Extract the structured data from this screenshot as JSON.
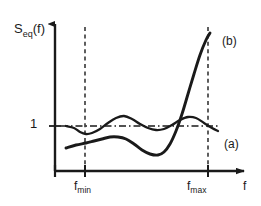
{
  "figure": {
    "kind": "line-plot",
    "background_color": "#ffffff",
    "ink_color": "#1a1a1a"
  },
  "axes": {
    "y_axis_label": "S",
    "y_axis_label_subscript": "eq",
    "y_axis_label_suffix": "(f)",
    "x_axis_label": "f",
    "y_reference_tick_label": "1",
    "x_tick_labels": [
      {
        "base": "f",
        "sub": "min"
      },
      {
        "base": "f",
        "sub": "max"
      }
    ]
  },
  "curve_labels": {
    "curve_a": "(a)",
    "curve_b": "(b)"
  },
  "chart_data": {
    "type": "line",
    "title": "",
    "xlabel": "f",
    "ylabel": "S_eq(f)",
    "xlim": [
      0,
      1
    ],
    "ylim": [
      0,
      1
    ],
    "grid": false,
    "legend_position": "inline-right",
    "annotations": [
      {
        "text": "(a)",
        "x_px": 224,
        "y_px": 138
      },
      {
        "text": "(b)",
        "x_px": 222,
        "y_px": 35
      },
      {
        "text": "1",
        "x_px": 30,
        "y_px": 117
      },
      {
        "text": "f_min",
        "x_px": 74,
        "y_px": 180
      },
      {
        "text": "f_max",
        "x_px": 187,
        "y_px": 180
      },
      {
        "text": "f",
        "x_px": 243,
        "y_px": 180
      }
    ],
    "reference_lines": [
      {
        "name": "unity-level",
        "orientation": "horizontal",
        "value_label": "1",
        "style": "dash-dot",
        "y_px": 126
      },
      {
        "name": "f-min-marker",
        "orientation": "vertical",
        "value_label": "f_min",
        "style": "dashed",
        "x_px": 85
      },
      {
        "name": "f-max-marker",
        "orientation": "vertical",
        "value_label": "f_max",
        "style": "dashed",
        "x_px": 208
      }
    ],
    "series": [
      {
        "name": "(a)",
        "description": "oscillating response staying near unity across the passband",
        "points_px": [
          [
            66,
            126
          ],
          [
            74,
            128
          ],
          [
            80,
            132
          ],
          [
            86,
            134
          ],
          [
            92,
            133
          ],
          [
            100,
            129
          ],
          [
            108,
            123
          ],
          [
            116,
            118
          ],
          [
            124,
            116
          ],
          [
            132,
            119
          ],
          [
            140,
            124
          ],
          [
            148,
            128
          ],
          [
            156,
            130
          ],
          [
            164,
            129
          ],
          [
            172,
            125
          ],
          [
            180,
            120
          ],
          [
            188,
            117
          ],
          [
            196,
            118
          ],
          [
            204,
            123
          ],
          [
            212,
            128
          ],
          [
            218,
            131
          ]
        ]
      },
      {
        "name": "(b)",
        "description": "low in the passband then rising steeply beyond f_max",
        "points_px": [
          [
            66,
            148
          ],
          [
            76,
            145
          ],
          [
            86,
            143
          ],
          [
            94,
            141
          ],
          [
            102,
            139
          ],
          [
            110,
            137
          ],
          [
            118,
            137
          ],
          [
            126,
            139
          ],
          [
            134,
            144
          ],
          [
            142,
            150
          ],
          [
            150,
            154
          ],
          [
            158,
            155
          ],
          [
            164,
            152
          ],
          [
            170,
            144
          ],
          [
            176,
            131
          ],
          [
            182,
            114
          ],
          [
            188,
            94
          ],
          [
            194,
            74
          ],
          [
            200,
            55
          ],
          [
            206,
            40
          ],
          [
            210,
            33
          ]
        ]
      }
    ],
    "axis_geometry_px": {
      "origin": [
        55,
        171
      ],
      "y_axis_top": [
        55,
        18
      ],
      "x_axis_right": [
        248,
        171
      ]
    }
  }
}
